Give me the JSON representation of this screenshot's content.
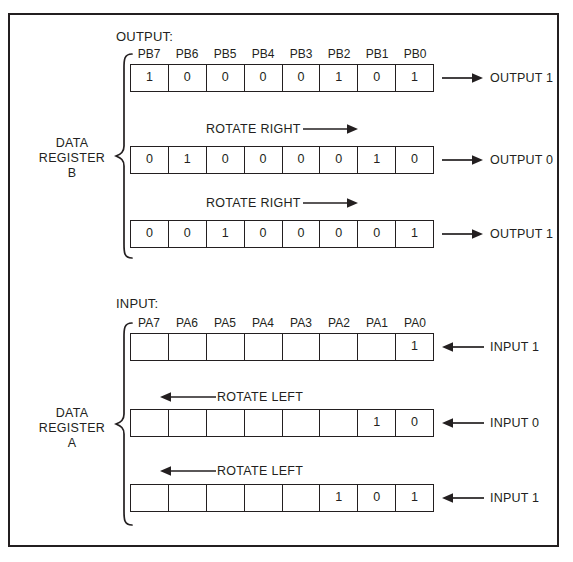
{
  "figure": {
    "border_color": "#231f20",
    "background": "#ffffff"
  },
  "sections": [
    {
      "id": "output-section",
      "caption": "OUTPUT:",
      "group_label_lines": [
        "DATA",
        "REGISTER",
        "B"
      ],
      "bit_labels": [
        "PB7",
        "PB6",
        "PB5",
        "PB4",
        "PB3",
        "PB2",
        "PB1",
        "PB0"
      ],
      "rows": [
        {
          "bits": [
            "1",
            "0",
            "0",
            "0",
            "0",
            "1",
            "0",
            "1"
          ],
          "io_label": "OUTPUT 1",
          "io_direction": "right",
          "rotate_note": null
        },
        {
          "bits": [
            "0",
            "1",
            "0",
            "0",
            "0",
            "0",
            "1",
            "0"
          ],
          "io_label": "OUTPUT 0",
          "io_direction": "right",
          "rotate_note": {
            "text": "ROTATE RIGHT",
            "direction": "right"
          }
        },
        {
          "bits": [
            "0",
            "0",
            "1",
            "0",
            "0",
            "0",
            "0",
            "1"
          ],
          "io_label": "OUTPUT 1",
          "io_direction": "right",
          "rotate_note": {
            "text": "ROTATE RIGHT",
            "direction": "right"
          }
        }
      ]
    },
    {
      "id": "input-section",
      "caption": "INPUT:",
      "group_label_lines": [
        "DATA",
        "REGISTER",
        "A"
      ],
      "bit_labels": [
        "PA7",
        "PA6",
        "PA5",
        "PA4",
        "PA3",
        "PA2",
        "PA1",
        "PA0"
      ],
      "rows": [
        {
          "bits": [
            "",
            "",
            "",
            "",
            "",
            "",
            "",
            "1"
          ],
          "io_label": "INPUT 1",
          "io_direction": "left",
          "rotate_note": null
        },
        {
          "bits": [
            "",
            "",
            "",
            "",
            "",
            "",
            "1",
            "0"
          ],
          "io_label": "INPUT 0",
          "io_direction": "left",
          "rotate_note": {
            "text": "ROTATE LEFT",
            "direction": "left"
          }
        },
        {
          "bits": [
            "",
            "",
            "",
            "",
            "",
            "1",
            "0",
            "1"
          ],
          "io_label": "INPUT 1",
          "io_direction": "left",
          "rotate_note": {
            "text": "ROTATE LEFT",
            "direction": "left"
          }
        }
      ]
    }
  ]
}
